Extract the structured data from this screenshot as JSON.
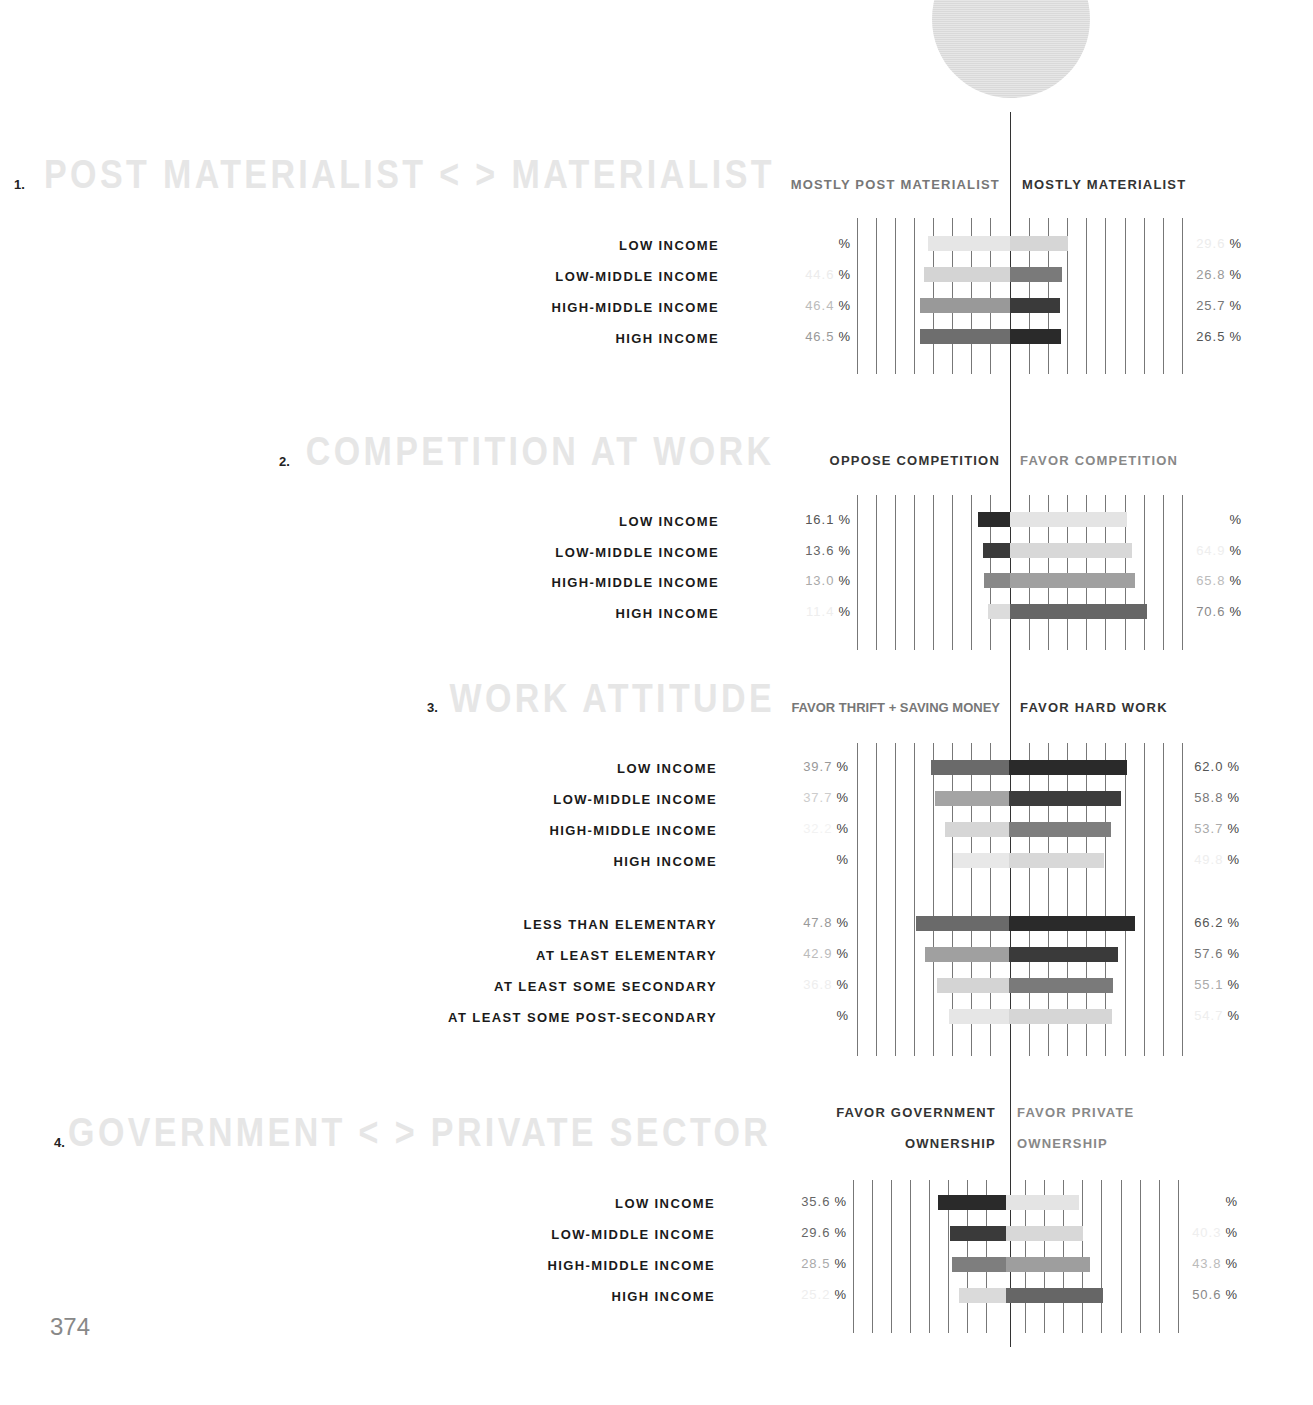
{
  "page_number": "374",
  "sections": [
    {
      "number": "1.",
      "title": "POST MATERIALIST < > MATERIALIST",
      "left_header": "MOSTLY POST MATERIALIST",
      "right_header": "MOSTLY MATERIALIST",
      "rows": [
        {
          "label": "LOW INCOME",
          "left": "",
          "right": "29.6"
        },
        {
          "label": "LOW-MIDDLE INCOME",
          "left": "44.6",
          "right": "26.8"
        },
        {
          "label": "HIGH-MIDDLE INCOME",
          "left": "46.4",
          "right": "25.7"
        },
        {
          "label": "HIGH INCOME",
          "left": "46.5",
          "right": "26.5"
        }
      ]
    },
    {
      "number": "2.",
      "title": "COMPETITION AT WORK",
      "left_header": "OPPOSE COMPETITION",
      "right_header": "FAVOR COMPETITION",
      "rows": [
        {
          "label": "LOW INCOME",
          "left": "16.1",
          "right": ""
        },
        {
          "label": "LOW-MIDDLE INCOME",
          "left": "13.6",
          "right": "64.9"
        },
        {
          "label": "HIGH-MIDDLE INCOME",
          "left": "13.0",
          "right": "65.8"
        },
        {
          "label": "HIGH INCOME",
          "left": "11.4",
          "right": "70.6"
        }
      ]
    },
    {
      "number": "3.",
      "title": "WORK ATTITUDE",
      "left_header": "FAVOR THRIFT + SAVING MONEY",
      "right_header": "FAVOR HARD WORK",
      "rows": [
        {
          "label": "LOW INCOME",
          "left": "39.7",
          "right": "62.0"
        },
        {
          "label": "LOW-MIDDLE INCOME",
          "left": "37.7",
          "right": "58.8"
        },
        {
          "label": "HIGH-MIDDLE INCOME",
          "left": "32.2",
          "right": "53.7"
        },
        {
          "label": "HIGH INCOME",
          "left": "",
          "right": "49.8"
        },
        {
          "label": "LESS THAN ELEMENTARY",
          "left": "47.8",
          "right": "66.2"
        },
        {
          "label": "AT LEAST ELEMENTARY",
          "left": "42.9",
          "right": "57.6"
        },
        {
          "label": "AT LEAST SOME SECONDARY",
          "left": "36.8",
          "right": "55.1"
        },
        {
          "label": "AT LEAST SOME POST-SECONDARY",
          "left": "",
          "right": "54.7"
        }
      ]
    },
    {
      "number": "4.",
      "title": "GOVERNMENT < > PRIVATE SECTOR",
      "left_header_line1": "FAVOR GOVERNMENT",
      "left_header_line2": "OWNERSHIP",
      "right_header_line1": "FAVOR PRIVATE",
      "right_header_line2": "OWNERSHIP",
      "rows": [
        {
          "label": "LOW INCOME",
          "left": "35.6",
          "right": ""
        },
        {
          "label": "LOW-MIDDLE INCOME",
          "left": "29.6",
          "right": "40.3"
        },
        {
          "label": "HIGH-MIDDLE INCOME",
          "left": "28.5",
          "right": "43.8"
        },
        {
          "label": "HIGH INCOME",
          "left": "25.2",
          "right": "50.6"
        }
      ]
    }
  ],
  "pct_symbol": "%",
  "chart_data": [
    {
      "type": "bar",
      "title": "POST MATERIALIST < > MATERIALIST",
      "orientation": "diverging-horizontal",
      "categories": [
        "LOW INCOME",
        "LOW-MIDDLE INCOME",
        "HIGH-MIDDLE INCOME",
        "HIGH INCOME"
      ],
      "series": [
        {
          "name": "MOSTLY POST MATERIALIST",
          "values": [
            45.0,
            44.6,
            46.4,
            46.5
          ]
        },
        {
          "name": "MOSTLY MATERIALIST",
          "values": [
            29.6,
            26.8,
            25.7,
            26.5
          ]
        }
      ],
      "xlabel": "%",
      "ylabel": "",
      "grid": true
    },
    {
      "type": "bar",
      "title": "COMPETITION AT WORK",
      "orientation": "diverging-horizontal",
      "categories": [
        "LOW INCOME",
        "LOW-MIDDLE INCOME",
        "HIGH-MIDDLE INCOME",
        "HIGH INCOME"
      ],
      "series": [
        {
          "name": "OPPOSE COMPETITION",
          "values": [
            16.1,
            13.6,
            13.0,
            11.4
          ]
        },
        {
          "name": "FAVOR COMPETITION",
          "values": [
            60.9,
            64.9,
            65.8,
            70.6
          ]
        }
      ],
      "xlabel": "%",
      "ylabel": "",
      "grid": true
    },
    {
      "type": "bar",
      "title": "WORK ATTITUDE",
      "orientation": "diverging-horizontal",
      "categories": [
        "LOW INCOME",
        "LOW-MIDDLE INCOME",
        "HIGH-MIDDLE INCOME",
        "HIGH INCOME",
        "LESS THAN ELEMENTARY",
        "AT LEAST ELEMENTARY",
        "AT LEAST SOME SECONDARY",
        "AT LEAST SOME POST-SECONDARY"
      ],
      "series": [
        {
          "name": "FAVOR THRIFT + SAVING MONEY",
          "values": [
            39.7,
            37.7,
            32.2,
            28.5,
            47.8,
            42.9,
            36.8,
            30.5
          ]
        },
        {
          "name": "FAVOR HARD WORK",
          "values": [
            62.0,
            58.8,
            53.7,
            49.8,
            66.2,
            57.6,
            55.1,
            54.7
          ]
        }
      ],
      "xlabel": "%",
      "ylabel": "",
      "grid": true
    },
    {
      "type": "bar",
      "title": "GOVERNMENT < > PRIVATE SECTOR",
      "orientation": "diverging-horizontal",
      "categories": [
        "LOW INCOME",
        "LOW-MIDDLE INCOME",
        "HIGH-MIDDLE INCOME",
        "HIGH INCOME"
      ],
      "series": [
        {
          "name": "FAVOR GOVERNMENT OWNERSHIP",
          "values": [
            35.6,
            29.6,
            28.5,
            25.2
          ]
        },
        {
          "name": "FAVOR PRIVATE OWNERSHIP",
          "values": [
            37.0,
            40.3,
            43.8,
            50.6
          ]
        }
      ],
      "xlabel": "%",
      "ylabel": "",
      "grid": true
    }
  ]
}
